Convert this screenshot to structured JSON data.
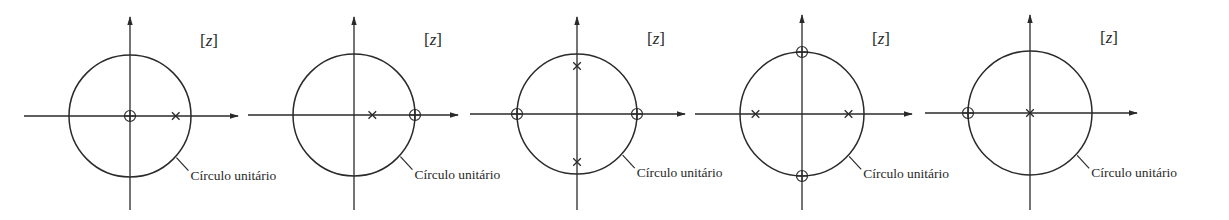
{
  "figure": {
    "plane_label_open": "[",
    "plane_label_var": "z",
    "plane_label_close": "]",
    "unit_circle_label": "Círculo unitário",
    "colors": {
      "stroke": "#2a2a2a",
      "background": "#ffffff"
    },
    "legend": {
      "zero_marker": "o (circle) = zero",
      "pole_marker": "x (cross) = pole"
    },
    "diagrams": [
      {
        "id": 1,
        "center": [
          130,
          116
        ],
        "radius": 61,
        "h_axis": [
          24,
          238
        ],
        "v_axis": [
          17,
          210
        ],
        "zeros": [
          [
            0,
            0
          ]
        ],
        "poles": [
          [
            0.75,
            0
          ]
        ],
        "z_label": "[z]",
        "circle_label": "Círculo unitário"
      },
      {
        "id": 2,
        "center": [
          354,
          115
        ],
        "radius": 61,
        "h_axis": [
          248,
          458
        ],
        "v_axis": [
          17,
          210
        ],
        "zeros": [
          [
            1,
            0
          ]
        ],
        "poles": [
          [
            0.3,
            0
          ]
        ],
        "z_label": "[z]",
        "circle_label": "Círculo unitário"
      },
      {
        "id": 3,
        "center": [
          577,
          114
        ],
        "radius": 60,
        "h_axis": [
          470,
          685
        ],
        "v_axis": [
          17,
          210
        ],
        "zeros": [
          [
            -1,
            0
          ],
          [
            1,
            0
          ]
        ],
        "poles": [
          [
            0,
            0.8
          ],
          [
            0,
            -0.8
          ]
        ],
        "z_label": "[z]",
        "circle_label": "Círculo unitário"
      },
      {
        "id": 4,
        "center": [
          802,
          114
        ],
        "radius": 62,
        "h_axis": [
          695,
          912
        ],
        "v_axis": [
          15,
          210
        ],
        "zeros": [
          [
            0,
            1
          ],
          [
            0,
            -1
          ]
        ],
        "poles": [
          [
            -0.75,
            0
          ],
          [
            0.75,
            0
          ]
        ],
        "z_label": "[z]",
        "circle_label": "Círculo unitário"
      },
      {
        "id": 5,
        "center": [
          1030,
          113
        ],
        "radius": 62,
        "h_axis": [
          925,
          1137
        ],
        "v_axis": [
          15,
          210
        ],
        "zeros": [
          [
            -1,
            0
          ]
        ],
        "poles": [
          [
            0,
            0
          ]
        ],
        "z_label": "[z]",
        "circle_label": "Círculo unitário"
      }
    ]
  }
}
